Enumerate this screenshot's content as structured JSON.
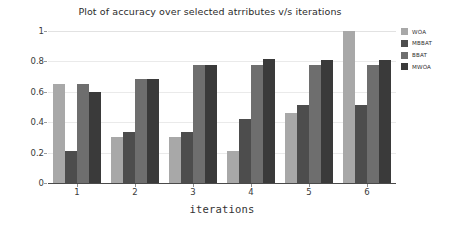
{
  "chart_data": {
    "type": "bar",
    "title": "Plot of accuracy over selected atrributes v/s iterations",
    "xlabel": "iterations",
    "ylabel": "accuracy",
    "categories": [
      "1",
      "2",
      "3",
      "4",
      "5",
      "6"
    ],
    "series": [
      {
        "name": "WOA",
        "color": "#a8a8a8",
        "values": [
          0.65,
          0.3,
          0.3,
          0.21,
          0.46,
          1.0
        ]
      },
      {
        "name": "MBBAT",
        "color": "#4d4d4d",
        "values": [
          0.21,
          0.335,
          0.335,
          0.42,
          0.51,
          0.51
        ]
      },
      {
        "name": "BBAT",
        "color": "#6e6e6e",
        "values": [
          0.65,
          0.685,
          0.775,
          0.775,
          0.775,
          0.775
        ]
      },
      {
        "name": "MWOA",
        "color": "#3a3a3a",
        "values": [
          0.6,
          0.685,
          0.775,
          0.815,
          0.81,
          0.81
        ]
      }
    ],
    "ylim": [
      0,
      1
    ],
    "yticks": [
      0,
      0.2,
      0.4,
      0.6,
      0.8,
      1
    ],
    "ytick_labels": [
      "0",
      "0.2",
      "0.4",
      "0.6",
      "0.8",
      "1"
    ],
    "grid": true,
    "grid_axis": "y",
    "legend_position": "right",
    "background_color": "#ffffff"
  }
}
